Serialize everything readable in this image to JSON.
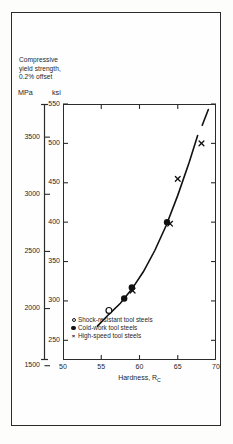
{
  "figure": {
    "background_color": "#fefefe",
    "frame_color": "#2b2b2b"
  },
  "y_axis_caption": {
    "line1": "Compressive",
    "line2": "yield strength,",
    "line3": "0.2% offset",
    "unit_left": "MPa",
    "unit_right": "ksi"
  },
  "chart_data": {
    "type": "scatter",
    "title": "",
    "subtitle": "",
    "xlabel": "Hardness, R_C",
    "xlabel_main": "Hardness, R",
    "xlabel_sub": "C",
    "ylabel": "Compressive yield strength, 0.2% offset",
    "ylabel_unit_primary": "ksi",
    "ylabel_unit_secondary": "MPa",
    "xlim": [
      50,
      70
    ],
    "ylim_ksi": [
      225,
      550
    ],
    "ylim_mpa": [
      1550,
      3790
    ],
    "grid": false,
    "legend_position": "inside-bottom-left",
    "x_ticks": [
      50,
      55,
      60,
      65,
      70
    ],
    "x_tick_labels": [
      "50",
      "55",
      "60",
      "65",
      "70"
    ],
    "y_ticks_ksi": [
      250,
      300,
      350,
      400,
      450,
      500,
      550
    ],
    "y_tick_labels_ksi": [
      "250",
      "300",
      "350",
      "400",
      "450",
      "500",
      "550"
    ],
    "y_ticks_mpa": [
      1500,
      2000,
      2500,
      3000,
      3500
    ],
    "y_tick_labels_mpa": [
      "1500",
      "2000",
      "2500",
      "3000",
      "3500"
    ],
    "series": [
      {
        "name": "Shock-resistant tool steels",
        "marker": "open-circle",
        "points": [
          {
            "x": 56.0,
            "y_ksi": 288
          }
        ]
      },
      {
        "name": "Cold-work tool steels",
        "marker": "filled-circle",
        "points": [
          {
            "x": 58.0,
            "y_ksi": 303
          },
          {
            "x": 59.0,
            "y_ksi": 317
          },
          {
            "x": 63.6,
            "y_ksi": 400
          }
        ]
      },
      {
        "name": "High-speed tool steels",
        "marker": "cross",
        "points": [
          {
            "x": 59.1,
            "y_ksi": 313
          },
          {
            "x": 64.0,
            "y_ksi": 398
          },
          {
            "x": 65.0,
            "y_ksi": 455
          },
          {
            "x": 68.1,
            "y_ksi": 500
          }
        ]
      }
    ],
    "trend_curve": {
      "name": "fitted trend",
      "style": "solid-with-break",
      "points": [
        {
          "x": 54.5,
          "y_ksi": 268
        },
        {
          "x": 56.0,
          "y_ksi": 283
        },
        {
          "x": 57.5,
          "y_ksi": 297
        },
        {
          "x": 59.0,
          "y_ksi": 315
        },
        {
          "x": 60.5,
          "y_ksi": 337
        },
        {
          "x": 62.0,
          "y_ksi": 364
        },
        {
          "x": 63.5,
          "y_ksi": 396
        },
        {
          "x": 65.0,
          "y_ksi": 434
        },
        {
          "x": 66.5,
          "y_ksi": 476
        },
        {
          "x": 67.6,
          "y_ksi": 510
        }
      ],
      "break_segment": [
        {
          "x": 68.2,
          "y_ksi": 523
        },
        {
          "x": 69.0,
          "y_ksi": 543
        }
      ]
    }
  },
  "legend": {
    "items": [
      {
        "marker": "open-circle",
        "label": "Shock-resistant tool steels"
      },
      {
        "marker": "filled-circle",
        "label": "Cold-work tool steels"
      },
      {
        "marker": "cross",
        "label": "High-speed tool steels"
      }
    ]
  }
}
